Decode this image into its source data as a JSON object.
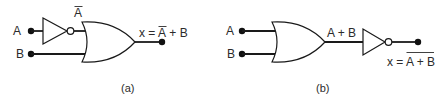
{
  "diagram_a": {
    "caption": "(a)",
    "input_a": "A",
    "input_b": "B",
    "inverter_output_label": "A",
    "inverter_output_label_overbar": true,
    "output_prefix": "x = ",
    "output_a_term": "A",
    "output_suffix": " + B",
    "output_expression": "x = Ā + B",
    "gates": [
      "NOT",
      "OR"
    ]
  },
  "diagram_b": {
    "caption": "(b)",
    "input_a": "A",
    "input_b": "B",
    "or_output_label": "A + B",
    "output_prefix": "x = ",
    "output_overbar_term": "A + B",
    "output_expression": "x = (A + B)̄",
    "gates": [
      "OR",
      "NOT"
    ]
  },
  "colors": {
    "line": "#1a1a1a",
    "text": "#2b2b2b",
    "background": "#ffffff"
  }
}
